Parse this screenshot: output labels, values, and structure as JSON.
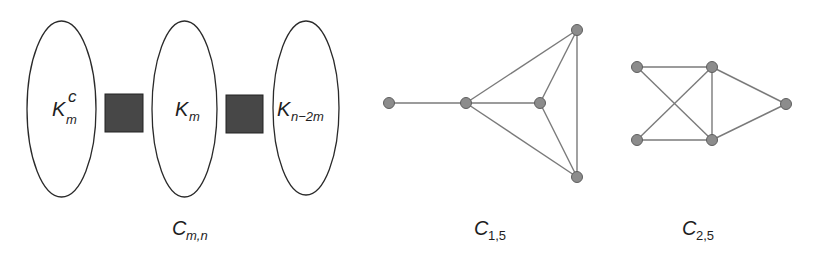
{
  "figure": {
    "panels": [
      {
        "id": "c_mn",
        "caption": {
          "main": "C",
          "sub": "m,n"
        },
        "parts": [
          {
            "type": "ellipse",
            "label": {
              "main": "K",
              "sub": "m",
              "sup": "c"
            }
          },
          {
            "type": "connector-block"
          },
          {
            "type": "ellipse",
            "label": {
              "main": "K",
              "sub": "m"
            }
          },
          {
            "type": "connector-block"
          },
          {
            "type": "ellipse",
            "label": {
              "main": "K",
              "sub": "n−2m"
            }
          }
        ]
      },
      {
        "id": "c_1_5",
        "caption": {
          "main": "C",
          "sub": "1,5"
        },
        "nodes": [
          {
            "id": "a",
            "x": 389,
            "y": 103
          },
          {
            "id": "b",
            "x": 466,
            "y": 103
          },
          {
            "id": "c",
            "x": 540,
            "y": 103
          },
          {
            "id": "d",
            "x": 577,
            "y": 30
          },
          {
            "id": "e",
            "x": 577,
            "y": 177
          }
        ],
        "edges": [
          [
            "a",
            "b"
          ],
          [
            "b",
            "c"
          ],
          [
            "b",
            "d"
          ],
          [
            "b",
            "e"
          ],
          [
            "c",
            "d"
          ],
          [
            "c",
            "e"
          ],
          [
            "d",
            "e"
          ]
        ]
      },
      {
        "id": "c_2_5",
        "caption": {
          "main": "C",
          "sub": "2,5"
        },
        "nodes": [
          {
            "id": "tl",
            "x": 637,
            "y": 67
          },
          {
            "id": "tr",
            "x": 712,
            "y": 67
          },
          {
            "id": "r",
            "x": 786,
            "y": 104
          },
          {
            "id": "bl",
            "x": 637,
            "y": 140
          },
          {
            "id": "br",
            "x": 712,
            "y": 140
          }
        ],
        "edges": [
          [
            "tl",
            "tr"
          ],
          [
            "tl",
            "br"
          ],
          [
            "bl",
            "tr"
          ],
          [
            "bl",
            "br"
          ],
          [
            "tr",
            "br"
          ],
          [
            "tr",
            "r"
          ],
          [
            "br",
            "r"
          ]
        ]
      }
    ],
    "colors": {
      "ellipse_stroke": "#2a2a2a",
      "block_fill": "#474747",
      "edge": "#7a7a7a",
      "node_fill": "#8c8c8c",
      "node_stroke": "#5e5e5e",
      "text": "#1e1e1e"
    }
  }
}
